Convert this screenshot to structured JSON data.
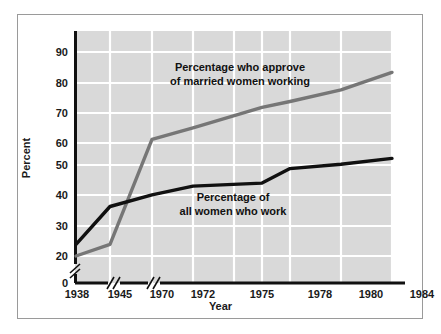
{
  "chart_data": {
    "type": "line",
    "title": "",
    "subtitle": "",
    "xlabel": "Year",
    "ylabel": "Percent",
    "grid": true,
    "legend_position": "inline-annotation",
    "x": [
      "1938",
      "1945",
      "1970",
      "1972",
      "1975",
      "1978",
      "1980",
      "1984"
    ],
    "categories": [
      "1938",
      "1945",
      "1970",
      "1972",
      "1975",
      "1978",
      "1980",
      "1984"
    ],
    "ylim": [
      0,
      95
    ],
    "yticks": [
      "0",
      "20",
      "30",
      "40",
      "50",
      "60",
      "70",
      "80",
      "90"
    ],
    "y_axis_break": true,
    "y_axis_break_between": [
      "0",
      "20"
    ],
    "x_axis_breaks_after": [
      "1938",
      "1945"
    ],
    "series": [
      {
        "name": "Percentage who approve of married women working",
        "color": "#767676",
        "values": [
          20,
          24,
          60,
          64,
          71,
          73,
          77,
          83
        ]
      },
      {
        "name": "Percentage of all women who work",
        "color": "#111111",
        "values": [
          24,
          37,
          41,
          44,
          45,
          50,
          51.5,
          53.5
        ]
      }
    ],
    "annotations": [
      {
        "id": "approve",
        "line1": "Percentage who approve",
        "line2": "of married women working"
      },
      {
        "id": "work",
        "line1": "Percentage of",
        "line2": "all women who work"
      }
    ]
  },
  "axes": {
    "y": {
      "label": "Percent",
      "ticks": [
        {
          "value": "90"
        },
        {
          "value": "80"
        },
        {
          "value": "70"
        },
        {
          "value": "60"
        },
        {
          "value": "50"
        },
        {
          "value": "40"
        },
        {
          "value": "30"
        },
        {
          "value": "20"
        },
        {
          "value": "0"
        }
      ]
    },
    "x": {
      "label": "Year",
      "ticks": [
        {
          "value": "1938"
        },
        {
          "value": "1945"
        },
        {
          "value": "1970"
        },
        {
          "value": "1972"
        },
        {
          "value": "1975"
        },
        {
          "value": "1978"
        },
        {
          "value": "1980"
        },
        {
          "value": "1984"
        }
      ]
    }
  },
  "colors": {
    "plot_background": "#d9d9d9",
    "gridline": "#ffffff",
    "axis": "#111111",
    "frame_border": "#9a9a9a",
    "page_background": "#ffffff",
    "series_approve": "#767676",
    "series_work": "#111111"
  }
}
